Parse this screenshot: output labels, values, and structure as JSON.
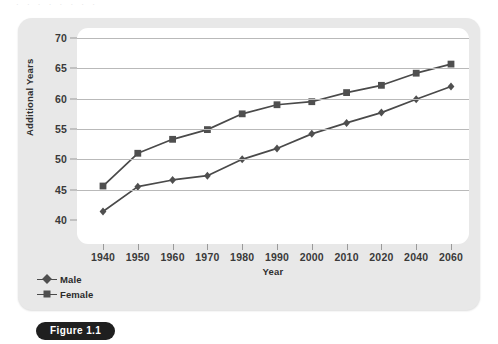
{
  "top_cut_text": "· · ·   ·   · ·   ·   ·",
  "figure": {
    "caption_label": "Figure 1.1"
  },
  "legend": {
    "position": "below-plot-left",
    "entries": [
      {
        "label": "Male",
        "marker": "diamond",
        "color": "#4f4f4f"
      },
      {
        "label": "Female",
        "marker": "square",
        "color": "#4f4f4f"
      }
    ]
  },
  "colors": {
    "panel_background": "#e8e8e8",
    "plot_background": "#ffffff",
    "gridline": "#b9b9b9",
    "series_line": "#4a4a4a",
    "series_marker": "#4f4f4f",
    "axis_text": "#3a3a3a",
    "caption_background": "#1f1f1f",
    "caption_text": "#ffffff"
  },
  "chart_data": {
    "type": "line",
    "title": "",
    "subtitle": "",
    "xlabel": "Year",
    "ylabel": "Additional Years",
    "categories": [
      "1940",
      "1950",
      "1960",
      "1970",
      "1980",
      "1990",
      "2000",
      "2010",
      "2020",
      "2040",
      "2060"
    ],
    "ylim": [
      40,
      70
    ],
    "yticks": [
      40,
      45,
      50,
      55,
      60,
      65,
      70
    ],
    "ytick_labels": [
      "40",
      "45",
      "50",
      "55",
      "60",
      "65",
      "70"
    ],
    "grid": "horizontal",
    "legend_position": "bottom-left",
    "series": [
      {
        "name": "Male",
        "marker": "diamond",
        "values": [
          41.4,
          45.5,
          46.6,
          47.3,
          50.0,
          51.8,
          54.2,
          56.0,
          57.7,
          59.9,
          62.0
        ]
      },
      {
        "name": "Female",
        "marker": "square",
        "values": [
          45.6,
          51.0,
          53.3,
          54.9,
          57.5,
          59.0,
          59.5,
          61.0,
          62.2,
          64.2,
          65.7
        ]
      }
    ]
  }
}
